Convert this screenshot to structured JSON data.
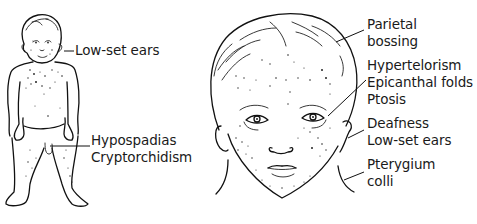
{
  "figure": {
    "panels": [
      {
        "id": "full-body",
        "labels": [
          {
            "text": "Low-set ears",
            "x": 75,
            "y": 42
          },
          {
            "text": "Hypospadias",
            "x": 91,
            "y": 132
          },
          {
            "text": "Cryptorchidism",
            "x": 91,
            "y": 149
          }
        ]
      },
      {
        "id": "face",
        "labels": [
          {
            "text": "Parietal",
            "x": 367,
            "y": 16
          },
          {
            "text": "bossing",
            "x": 367,
            "y": 33
          },
          {
            "text": "Hypertelorism",
            "x": 367,
            "y": 57
          },
          {
            "text": "Epicanthal folds",
            "x": 367,
            "y": 74
          },
          {
            "text": "Ptosis",
            "x": 367,
            "y": 91
          },
          {
            "text": "Deafness",
            "x": 367,
            "y": 115
          },
          {
            "text": "Low-set ears",
            "x": 367,
            "y": 132
          },
          {
            "text": "Pterygium",
            "x": 367,
            "y": 156
          },
          {
            "text": "colli",
            "x": 367,
            "y": 173
          }
        ]
      }
    ]
  },
  "colors": {
    "ink": "#111111",
    "background": "#ffffff"
  }
}
